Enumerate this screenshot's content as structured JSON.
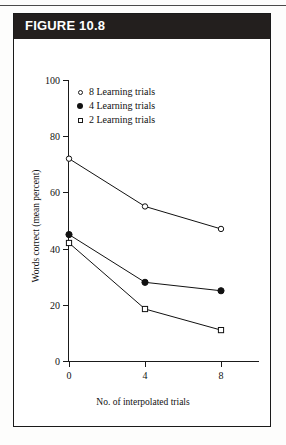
{
  "figure": {
    "header_label": "FIGURE 10.8"
  },
  "chart_data": {
    "type": "line",
    "title": "",
    "subtitle": "",
    "xlabel": "No. of interpolated trials",
    "ylabel": "Words correct (mean percent)",
    "x": [
      0,
      4,
      8
    ],
    "xticklabels": [
      "0",
      "4",
      "8"
    ],
    "yticklabels": [
      "0",
      "20",
      "40",
      "60",
      "80",
      "100"
    ],
    "yticks": [
      0,
      20,
      40,
      60,
      80,
      100
    ],
    "xlim": [
      -1,
      9.6
    ],
    "ylim": [
      0,
      100
    ],
    "grid": false,
    "legend_position": "upper-left-inside",
    "series": [
      {
        "name": "8 Learning trials",
        "legend_label": "8  Learning trials",
        "marker": "open-circle",
        "color": "#111111",
        "values": [
          72,
          55,
          47
        ]
      },
      {
        "name": "4 Learning trials",
        "legend_label": "4  Learning trials",
        "marker": "filled-circle",
        "color": "#111111",
        "values": [
          45,
          28,
          25
        ]
      },
      {
        "name": "2 Learning trials",
        "legend_label": "2  Learning trials",
        "marker": "open-square",
        "color": "#111111",
        "values": [
          42,
          18.5,
          11
        ]
      }
    ]
  }
}
